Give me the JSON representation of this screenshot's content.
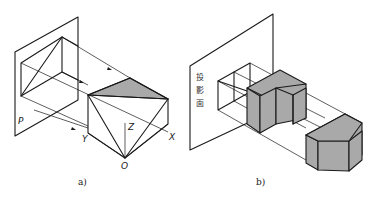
{
  "figure_a": {
    "caption": "a)",
    "labels": {
      "plane": "P",
      "x_axis": "X",
      "y_axis": "Y",
      "z_axis": "Z",
      "origin": "O"
    }
  },
  "figure_b": {
    "caption": "b)",
    "plane_label": [
      "投",
      "影",
      "面"
    ]
  },
  "colors": {
    "line": "#1a1a1a",
    "shade": "#a9a9a9",
    "background": "#ffffff"
  }
}
